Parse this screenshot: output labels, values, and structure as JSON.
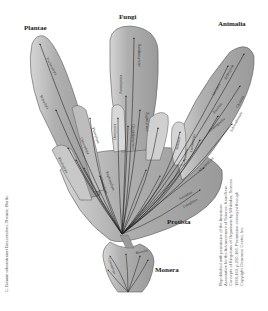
{
  "diagram": {
    "kingdoms": [
      {
        "name": "Plantae",
        "x": 24,
        "y": 28
      },
      {
        "name": "Fungi",
        "x": 119,
        "y": 16
      },
      {
        "name": "Animalia",
        "x": 218,
        "y": 24
      },
      {
        "name": "Protista",
        "x": 167,
        "y": 223
      },
      {
        "name": "Monera",
        "x": 155,
        "y": 270
      }
    ],
    "branches": {
      "plantae": [
        "Tracheophyta",
        "Bryophyta",
        "Chlorophyta",
        "Phaeophyta",
        "Rhodophyta",
        "Charophyta"
      ],
      "fungi": [
        "Basidiomycetes",
        "Ascomycetes",
        "Zygomycetes",
        "Oomycetes",
        "Chytridiomycetes"
      ],
      "animalia": [
        "Mollusca",
        "Arthropoda",
        "Annelida",
        "Chordata",
        "Echinodermata",
        "Chaetognatha",
        "Porifera",
        "Coelenterata",
        "Mesozoa"
      ],
      "protista": [
        "Euglenophyta",
        "Sarcodina",
        "Ciliophora",
        "Myxomycota"
      ],
      "monera": [
        "Bacteria",
        "Cyanophyta"
      ]
    },
    "colors": {
      "lobe_fill": "#a9a9a9",
      "lobe_highlight": "#dcdcdc",
      "lobe_stroke": "#5a5a5a",
      "branch_line": "#1e1e1e",
      "background": "#ffffff"
    }
  },
  "credits": {
    "left": "C. Darwin rekonstruiert Deszendenz-Theorie, Berlin.",
    "right_lines": [
      "Republished with permission of the American",
      "Association for the Advancement of Science, from New",
      "Concepts of Kingdoms of Organisms by Whittaker, Science",
      "1969;163, p.150-160. Permission conveyed through",
      "Copyright Clearance Center, Inc."
    ]
  }
}
